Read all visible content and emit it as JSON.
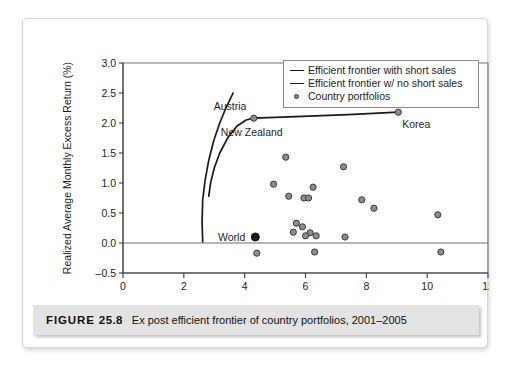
{
  "figure": {
    "label": "FIGURE",
    "number": "25.8",
    "caption": "Ex post efficient frontier of country portfolios, 2001–2005"
  },
  "legend": {
    "position": "top-right",
    "items": [
      {
        "marker": "line",
        "label": "Efficient frontier with short sales"
      },
      {
        "marker": "line",
        "label": "Efficient frontier w/ no short sales"
      },
      {
        "marker": "circle",
        "label": "Country portfolios"
      }
    ]
  },
  "colors": {
    "frontier": "#1a1a1a",
    "point_fill": "#8d8d8d",
    "point_stroke": "#3c3c3c",
    "world_point": "#1b1b1b",
    "axis": "#3b3b3b",
    "caption_bar": "#e3e3e3"
  },
  "chart_data": {
    "type": "scatter",
    "title": "",
    "xlabel": "Standard Deviation (% per month)",
    "ylabel": "Realized Average Monthly Excess Return (%)",
    "xlim": [
      0,
      12
    ],
    "ylim": [
      -0.5,
      3.0
    ],
    "xticks": [
      0,
      2,
      4,
      6,
      8,
      10,
      12
    ],
    "yticks": [
      -0.5,
      0.0,
      0.5,
      1.0,
      1.5,
      2.0,
      2.5,
      3.0
    ],
    "xtick_labels": [
      "0",
      "2",
      "4",
      "6",
      "8",
      "10",
      "12"
    ],
    "ytick_labels": [
      "-0.5",
      "0.0",
      "0.5",
      "1.0",
      "1.5",
      "2.0",
      "2.5",
      "3.0"
    ],
    "grid": false,
    "zero_line": true,
    "series": [
      {
        "name": "Country portfolios",
        "type": "scatter",
        "points": [
          {
            "x": 4.3,
            "y": 2.08,
            "label": "Austria"
          },
          {
            "x": 9.05,
            "y": 2.18,
            "label": "Korea"
          },
          {
            "x": 4.35,
            "y": 0.1,
            "label": "World"
          },
          {
            "x": 5.35,
            "y": 1.43,
            "label": ""
          },
          {
            "x": 7.25,
            "y": 1.27,
            "label": ""
          },
          {
            "x": 4.95,
            "y": 0.98,
            "label": ""
          },
          {
            "x": 6.25,
            "y": 0.93,
            "label": ""
          },
          {
            "x": 5.45,
            "y": 0.78,
            "label": ""
          },
          {
            "x": 5.95,
            "y": 0.75,
            "label": ""
          },
          {
            "x": 6.1,
            "y": 0.75,
            "label": ""
          },
          {
            "x": 7.85,
            "y": 0.72,
            "label": ""
          },
          {
            "x": 8.25,
            "y": 0.58,
            "label": ""
          },
          {
            "x": 10.35,
            "y": 0.47,
            "label": ""
          },
          {
            "x": 5.7,
            "y": 0.33,
            "label": ""
          },
          {
            "x": 5.9,
            "y": 0.27,
            "label": ""
          },
          {
            "x": 5.6,
            "y": 0.18,
            "label": ""
          },
          {
            "x": 6.15,
            "y": 0.17,
            "label": ""
          },
          {
            "x": 6.0,
            "y": 0.12,
            "label": ""
          },
          {
            "x": 6.35,
            "y": 0.12,
            "label": ""
          },
          {
            "x": 7.3,
            "y": 0.1,
            "label": ""
          },
          {
            "x": 4.4,
            "y": -0.17,
            "label": ""
          },
          {
            "x": 6.3,
            "y": -0.15,
            "label": ""
          },
          {
            "x": 10.45,
            "y": -0.15,
            "label": ""
          }
        ]
      },
      {
        "name": "Efficient frontier with short sales",
        "type": "line",
        "points": [
          {
            "x": 2.62,
            "y": 0.02
          },
          {
            "x": 2.6,
            "y": 0.35
          },
          {
            "x": 2.62,
            "y": 0.72
          },
          {
            "x": 2.7,
            "y": 1.05
          },
          {
            "x": 2.82,
            "y": 1.38
          },
          {
            "x": 2.98,
            "y": 1.7
          },
          {
            "x": 3.18,
            "y": 2.0
          },
          {
            "x": 3.4,
            "y": 2.27
          },
          {
            "x": 3.62,
            "y": 2.5
          }
        ]
      },
      {
        "name": "Efficient frontier w/ no short sales",
        "type": "line",
        "points": [
          {
            "x": 2.82,
            "y": 0.78
          },
          {
            "x": 2.88,
            "y": 1.0
          },
          {
            "x": 3.0,
            "y": 1.25
          },
          {
            "x": 3.18,
            "y": 1.5
          },
          {
            "x": 3.45,
            "y": 1.76
          },
          {
            "x": 3.75,
            "y": 1.95
          },
          {
            "x": 4.05,
            "y": 2.05
          },
          {
            "x": 4.3,
            "y": 2.08
          },
          {
            "x": 5.9,
            "y": 2.11
          },
          {
            "x": 7.4,
            "y": 2.14
          },
          {
            "x": 9.05,
            "y": 2.18
          }
        ]
      }
    ],
    "annotations": [
      {
        "text": "Austria",
        "x": 4.3,
        "y": 2.08
      },
      {
        "text": "New Zealand",
        "x": 4.4,
        "y": 1.62
      },
      {
        "text": "Korea",
        "x": 9.05,
        "y": 2.18
      },
      {
        "text": "World",
        "x": 4.35,
        "y": 0.1
      }
    ]
  }
}
